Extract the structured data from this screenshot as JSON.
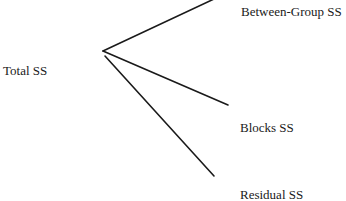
{
  "diagram": {
    "type": "partition-tree",
    "root": {
      "label": "Total SS"
    },
    "branches": [
      {
        "label": "Between-Group SS"
      },
      {
        "label": "Blocks SS"
      },
      {
        "label": "Residual SS"
      }
    ],
    "line_color": "#1a1a1a",
    "background": "#ffffff"
  }
}
